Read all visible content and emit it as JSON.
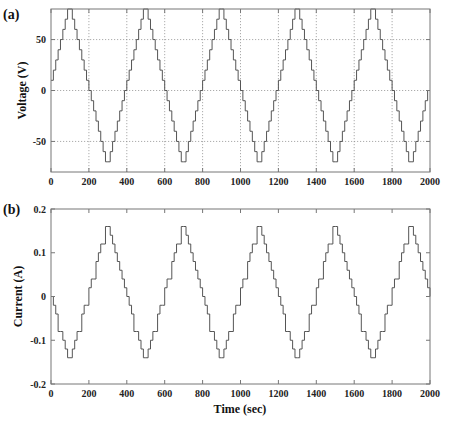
{
  "chart_data": [
    {
      "panel": "(a)",
      "type": "line",
      "style": "staircase",
      "title": "",
      "xlabel": "",
      "ylabel": "Voltage (V)",
      "xlim": [
        0,
        2000
      ],
      "ylim": [
        -80,
        80
      ],
      "xticks": [
        0,
        200,
        400,
        600,
        800,
        1000,
        1200,
        1400,
        1600,
        1800,
        2000
      ],
      "yticks": [
        -50,
        0,
        50
      ],
      "grid": true,
      "series": [
        {
          "name": "Voltage",
          "waveform": "stepped-triangle",
          "period": 400,
          "amplitude": 80,
          "step_size": 10,
          "step_duration": 12.5,
          "phase": "rises from 0 to +80 at t=100, falls to -80 at t=300",
          "x": [
            0,
            100,
            300,
            500,
            700,
            900,
            1100,
            1300,
            1500,
            1700,
            1900,
            2000
          ],
          "values": [
            0,
            80,
            -80,
            80,
            -80,
            80,
            -80,
            80,
            -80,
            80,
            -80,
            0
          ]
        }
      ]
    },
    {
      "panel": "(b)",
      "type": "line",
      "style": "staircase",
      "title": "",
      "xlabel": "Time (sec)",
      "ylabel": "Current (A)",
      "xlim": [
        0,
        2000
      ],
      "ylim": [
        -0.2,
        0.2
      ],
      "xticks": [
        0,
        200,
        400,
        600,
        800,
        1000,
        1200,
        1400,
        1600,
        1800,
        2000
      ],
      "yticks": [
        -0.2,
        -0.1,
        0,
        0.1,
        0.2
      ],
      "grid": false,
      "series": [
        {
          "name": "Current",
          "waveform": "stepped-triangle",
          "period": 400,
          "amplitude": 0.16,
          "step_size": 0.02,
          "step_duration": 12.5,
          "phase": "falls from 0 to -0.16 at t=100, rises to +0.16 at t=300",
          "x": [
            0,
            100,
            300,
            500,
            700,
            900,
            1100,
            1300,
            1500,
            1700,
            1900,
            2000
          ],
          "values": [
            0,
            -0.16,
            0.16,
            -0.16,
            0.16,
            -0.16,
            0.16,
            -0.16,
            0.16,
            -0.16,
            0.16,
            0
          ]
        }
      ]
    }
  ],
  "labels": {
    "panel_a": "(a)",
    "panel_b": "(b)",
    "ylabel_a": "Voltage (V)",
    "ylabel_b": "Current (A)",
    "xlabel": "Time (sec)",
    "xticks": [
      "0",
      "200",
      "400",
      "600",
      "800",
      "1000",
      "1200",
      "1400",
      "1600",
      "1800",
      "2000"
    ],
    "yticks_a": [
      "50",
      "0",
      "-50"
    ],
    "yticks_b": [
      "0.2",
      "0.1",
      "0",
      "-0.1",
      "-0.2"
    ]
  }
}
